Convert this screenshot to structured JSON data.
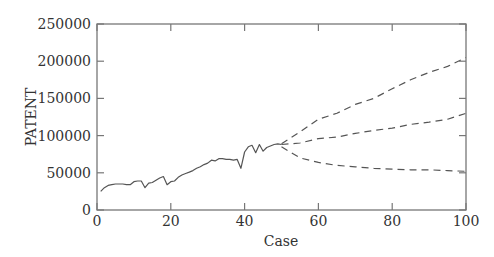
{
  "chart_data": {
    "type": "line",
    "title": "",
    "xlabel": "Case",
    "ylabel": "PATENT",
    "xlim": [
      0,
      100
    ],
    "ylim": [
      0,
      250000
    ],
    "xticks": [
      0,
      20,
      40,
      60,
      80,
      100
    ],
    "yticks": [
      0,
      50000,
      100000,
      150000,
      200000,
      250000
    ],
    "grid": false,
    "legend": null,
    "series": [
      {
        "name": "observed",
        "style": "solid",
        "x": [
          1,
          2,
          3,
          4,
          5,
          6,
          7,
          8,
          9,
          10,
          11,
          12,
          13,
          14,
          15,
          16,
          17,
          18,
          19,
          20,
          21,
          22,
          23,
          24,
          25,
          26,
          27,
          28,
          29,
          30,
          31,
          32,
          33,
          34,
          35,
          36,
          37,
          38,
          39,
          40,
          41,
          42,
          43,
          44,
          45,
          46,
          47,
          48,
          49,
          50
        ],
        "values": [
          25000,
          30000,
          33000,
          34000,
          35000,
          35000,
          35000,
          34000,
          34000,
          38000,
          39000,
          39000,
          30000,
          36000,
          37000,
          40000,
          43000,
          45000,
          34000,
          38000,
          39000,
          44000,
          47000,
          49000,
          51000,
          53000,
          56000,
          58000,
          61000,
          63000,
          67000,
          66000,
          69000,
          69000,
          68000,
          68000,
          67000,
          68000,
          56000,
          78000,
          85000,
          87000,
          77000,
          88000,
          79000,
          84000,
          86000,
          88000,
          89000,
          88000
        ]
      },
      {
        "name": "forecast upper",
        "style": "dashed",
        "x": [
          50,
          55,
          60,
          65,
          70,
          75,
          80,
          85,
          90,
          95,
          100
        ],
        "values": [
          89000,
          105000,
          122000,
          130000,
          142000,
          150000,
          163000,
          175000,
          185000,
          193000,
          205000
        ]
      },
      {
        "name": "forecast median",
        "style": "dashed",
        "x": [
          50,
          55,
          60,
          65,
          70,
          75,
          80,
          85,
          90,
          95,
          100
        ],
        "values": [
          88000,
          90000,
          96000,
          98000,
          103000,
          107000,
          110000,
          115000,
          118000,
          122000,
          130000
        ]
      },
      {
        "name": "forecast lower",
        "style": "dashed",
        "x": [
          50,
          55,
          60,
          65,
          70,
          75,
          80,
          85,
          90,
          95,
          100
        ],
        "values": [
          85000,
          70000,
          64000,
          60000,
          58000,
          56000,
          55000,
          54000,
          54000,
          53000,
          52000
        ]
      }
    ]
  }
}
